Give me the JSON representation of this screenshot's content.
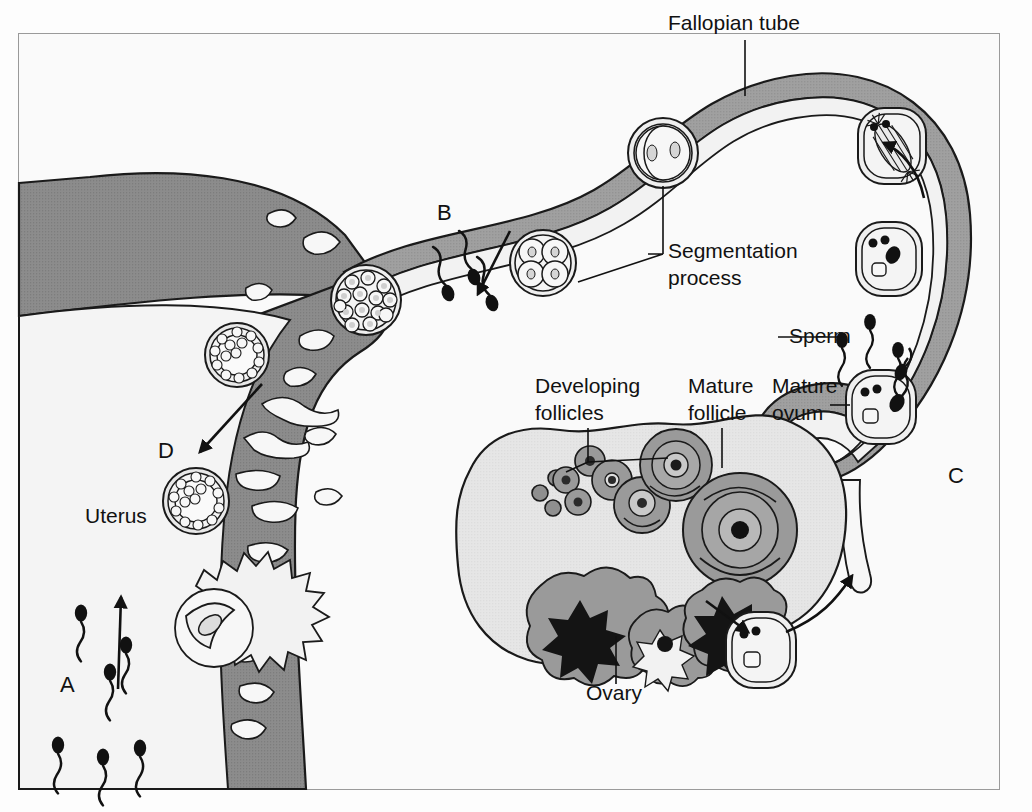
{
  "figure": {
    "background_color": "#fafafa",
    "border_color": "#9a9a9a"
  },
  "palette": {
    "outline": "#1a1a1a",
    "tube_wall": "#7d7d7d",
    "tube_lumen": "#f0f0f0",
    "uterus_wall": "#8a8a8a",
    "endometrium": "#8a8a8a",
    "ovary_body": "#e4e4e4",
    "follicle_fill": "#9b9b9b",
    "follicle_dark": "#141414",
    "cell_fill": "#ededed",
    "sperm_color": "#111111",
    "label_color": "#111111"
  },
  "labels": [
    {
      "id": "fallopian-tube",
      "text": "Fallopian tube",
      "x": 668,
      "y": 30,
      "anchor": "start"
    },
    {
      "id": "segmentation",
      "text": "Segmentation",
      "x": 668,
      "y": 258,
      "anchor": "start"
    },
    {
      "id": "segmentation-2",
      "text": "process",
      "x": 668,
      "y": 285,
      "anchor": "start"
    },
    {
      "id": "sperm",
      "text": "Sperm",
      "x": 789,
      "y": 343,
      "anchor": "start"
    },
    {
      "id": "mature-ovum",
      "text": "Mature",
      "x": 772,
      "y": 393,
      "anchor": "start"
    },
    {
      "id": "mature-ovum-2",
      "text": "ovum",
      "x": 772,
      "y": 420,
      "anchor": "start"
    },
    {
      "id": "mature-follicle",
      "text": "Mature",
      "x": 688,
      "y": 393,
      "anchor": "start"
    },
    {
      "id": "mature-follicle-2",
      "text": "follicle",
      "x": 688,
      "y": 420,
      "anchor": "start"
    },
    {
      "id": "developing",
      "text": "Developing",
      "x": 535,
      "y": 393,
      "anchor": "start"
    },
    {
      "id": "developing-2",
      "text": "follicles",
      "x": 535,
      "y": 420,
      "anchor": "start"
    },
    {
      "id": "ovary",
      "text": "Ovary",
      "x": 586,
      "y": 700,
      "anchor": "start"
    },
    {
      "id": "uterus",
      "text": "Uterus",
      "x": 85,
      "y": 523,
      "anchor": "start"
    }
  ],
  "markers": [
    {
      "id": "marker-a",
      "text": "A",
      "x": 60,
      "y": 692
    },
    {
      "id": "marker-b",
      "text": "B",
      "x": 437,
      "y": 220
    },
    {
      "id": "marker-c",
      "text": "C",
      "x": 948,
      "y": 483
    },
    {
      "id": "marker-d",
      "text": "D",
      "x": 158,
      "y": 458
    }
  ],
  "stages": [
    {
      "id": "mature-ovum-cell",
      "name": "Mature ovum with sperm",
      "x": 880,
      "y": 405
    },
    {
      "id": "fertilized-ovum",
      "name": "Fertilized ovum",
      "x": 889,
      "y": 258
    },
    {
      "id": "spindle-stage",
      "name": "Mitotic spindle stage",
      "x": 890,
      "y": 145
    },
    {
      "id": "two-cell-stage",
      "name": "Two-cell stage",
      "x": 663,
      "y": 153
    },
    {
      "id": "four-cell-stage",
      "name": "Four-cell stage",
      "x": 543,
      "y": 263
    },
    {
      "id": "morula-stage",
      "name": "Morula",
      "x": 366,
      "y": 300
    },
    {
      "id": "blastocyst-descending",
      "name": "Blastocyst in uterus",
      "x": 237,
      "y": 355
    },
    {
      "id": "blastocyst-implanting",
      "name": "Implanting blastocyst",
      "x": 196,
      "y": 501
    },
    {
      "id": "implanted-embryo",
      "name": "Implanted embryo",
      "x": 210,
      "y": 630
    },
    {
      "id": "released-ovum",
      "name": "Ovulated ovum",
      "x": 760,
      "y": 650
    }
  ],
  "arrows": [
    {
      "id": "arrow-ovulation",
      "desc": "ovum toward fimbriae"
    },
    {
      "id": "arrow-tube-up",
      "desc": "transport up the tube"
    },
    {
      "id": "arrow-segment",
      "desc": "cleavage travel toward uterus"
    },
    {
      "id": "arrow-implant",
      "desc": "blastocyst descending to implant"
    },
    {
      "id": "arrow-sperm-up",
      "desc": "sperm ascending through uterus"
    },
    {
      "id": "arrow-release",
      "desc": "follicle rupture release"
    }
  ]
}
